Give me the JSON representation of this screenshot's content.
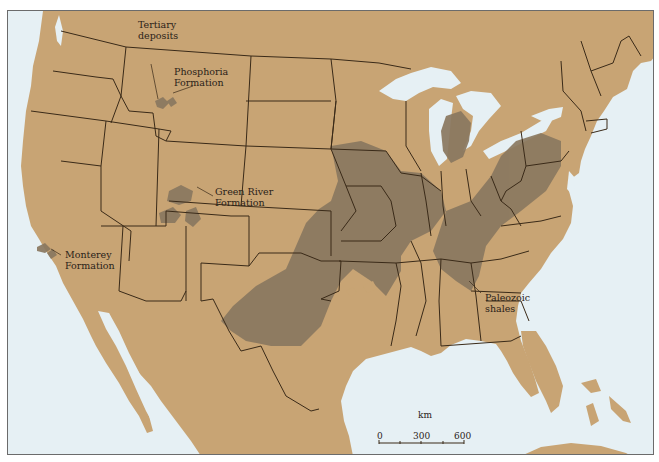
{
  "map": {
    "colors": {
      "land": "#c8a474",
      "water": "#e6f0f4",
      "shale": "#8a7860",
      "border": "#3a2a18"
    },
    "labels": {
      "tertiary": "Tertiary\ndeposits",
      "phosphoria": "Phosphoria\nFormation",
      "green_river": "Green River\nFormation",
      "monterey": "Monterey\nFormation",
      "paleozoic": "Paleozoic\nshales"
    },
    "scale_bar": {
      "unit": "km",
      "ticks": [
        "0",
        "300",
        "600"
      ]
    }
  }
}
